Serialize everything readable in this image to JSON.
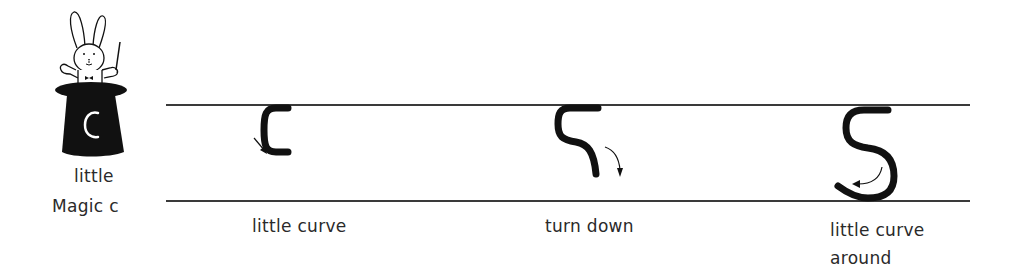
{
  "mascot": {
    "description": "rabbit in magic hat holding wand",
    "hat_letter": "c",
    "caption_line1": "little",
    "caption_line2": "Magic c"
  },
  "guide_lines": {
    "top_y": 105,
    "bottom_y": 201,
    "x_start": 166,
    "x_end": 970,
    "color": "#3a3a3a"
  },
  "steps": [
    {
      "stroke": "little-curve-stroke",
      "label": "little curve"
    },
    {
      "stroke": "turn-down-stroke",
      "label": "turn down"
    },
    {
      "stroke": "little-curve-around-stroke",
      "label_line1": "little curve",
      "label_line2": "around"
    }
  ],
  "colors": {
    "ink": "#111111",
    "text": "#2a2a2a",
    "background": "#ffffff"
  }
}
